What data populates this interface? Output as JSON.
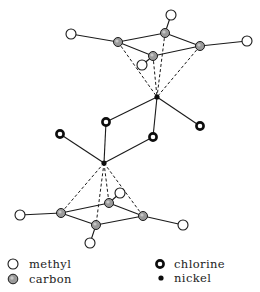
{
  "diagram": {
    "title": "",
    "atoms": {
      "top_ring": {
        "methyl_left": {
          "x": 71,
          "y": 34,
          "type": "methyl"
        },
        "carbon_a": {
          "x": 118,
          "y": 42,
          "type": "carbon"
        },
        "carbon_b": {
          "x": 165,
          "y": 33,
          "type": "carbon"
        },
        "methyl_top": {
          "x": 171,
          "y": 15,
          "type": "methyl"
        },
        "carbon_c": {
          "x": 153,
          "y": 56,
          "type": "carbon"
        },
        "methyl_front": {
          "x": 142,
          "y": 65,
          "type": "methyl"
        },
        "carbon_d": {
          "x": 200,
          "y": 46,
          "type": "carbon"
        },
        "methyl_right": {
          "x": 247,
          "y": 41,
          "type": "methyl"
        }
      },
      "upper_nickel": {
        "x": 157,
        "y": 97,
        "type": "nickel"
      },
      "chlorine_bridge_upper": {
        "x": 106,
        "y": 122,
        "type": "chlorine"
      },
      "chlorine_bridge_lower": {
        "x": 153,
        "y": 137,
        "type": "chlorine"
      },
      "chlorine_terminal_right": {
        "x": 200,
        "y": 126,
        "type": "chlorine"
      },
      "chlorine_terminal_left": {
        "x": 60,
        "y": 134,
        "type": "chlorine"
      },
      "lower_nickel": {
        "x": 104,
        "y": 163,
        "type": "nickel"
      },
      "bottom_ring": {
        "methyl_left": {
          "x": 20,
          "y": 215,
          "type": "methyl"
        },
        "carbon_e": {
          "x": 61,
          "y": 213,
          "type": "carbon"
        },
        "carbon_f": {
          "x": 109,
          "y": 203,
          "type": "carbon"
        },
        "methyl_back": {
          "x": 120,
          "y": 193,
          "type": "methyl"
        },
        "carbon_g": {
          "x": 96,
          "y": 225,
          "type": "carbon"
        },
        "methyl_bottom": {
          "x": 90,
          "y": 243,
          "type": "methyl"
        },
        "carbon_h": {
          "x": 143,
          "y": 216,
          "type": "carbon"
        },
        "methyl_right": {
          "x": 183,
          "y": 225,
          "type": "methyl"
        }
      }
    }
  },
  "legend": {
    "items": [
      {
        "key": "methyl",
        "label": "methyl",
        "icon": "open-circle"
      },
      {
        "key": "carbon",
        "label": "carbon",
        "icon": "shaded-circle"
      },
      {
        "key": "chlorine",
        "label": "chlorine",
        "icon": "thick-ring"
      },
      {
        "key": "nickel",
        "label": "nickel",
        "icon": "filled-dot"
      }
    ]
  },
  "colors": {
    "line": "#1a1a1a",
    "carbon_fill": "#9a9a9a",
    "nickel_fill": "#0d0d0d",
    "background": "#ffffff"
  }
}
